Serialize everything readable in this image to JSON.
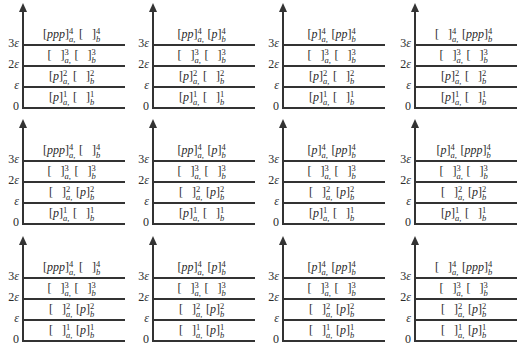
{
  "figure": {
    "y_axis_labels": [
      "0",
      "ε",
      "2ε",
      "3ε"
    ],
    "y_axis_label_parts": [
      {
        "coef": "0",
        "sym": ""
      },
      {
        "coef": "",
        "sym": "ε"
      },
      {
        "coef": "2",
        "sym": "ε"
      },
      {
        "coef": "3",
        "sym": "ε"
      }
    ],
    "group_a_subscript": "a,",
    "group_b_subscript": "b",
    "panels": [
      {
        "row": 1,
        "col": 1,
        "levels": [
          {
            "level": 1,
            "a": "p",
            "b": ""
          },
          {
            "level": 2,
            "a": "p",
            "b": ""
          },
          {
            "level": 3,
            "a": "",
            "b": ""
          },
          {
            "level": 4,
            "a": "ppp",
            "b": ""
          }
        ]
      },
      {
        "row": 1,
        "col": 2,
        "levels": [
          {
            "level": 1,
            "a": "p",
            "b": ""
          },
          {
            "level": 2,
            "a": "p",
            "b": ""
          },
          {
            "level": 3,
            "a": "",
            "b": ""
          },
          {
            "level": 4,
            "a": "pp",
            "b": "p"
          }
        ]
      },
      {
        "row": 1,
        "col": 3,
        "levels": [
          {
            "level": 1,
            "a": "p",
            "b": ""
          },
          {
            "level": 2,
            "a": "p",
            "b": ""
          },
          {
            "level": 3,
            "a": "",
            "b": ""
          },
          {
            "level": 4,
            "a": "p",
            "b": "pp"
          }
        ]
      },
      {
        "row": 1,
        "col": 4,
        "levels": [
          {
            "level": 1,
            "a": "p",
            "b": ""
          },
          {
            "level": 2,
            "a": "p",
            "b": ""
          },
          {
            "level": 3,
            "a": "",
            "b": ""
          },
          {
            "level": 4,
            "a": "",
            "b": "ppp"
          }
        ]
      },
      {
        "row": 2,
        "col": 1,
        "levels": [
          {
            "level": 1,
            "a": "p",
            "b": ""
          },
          {
            "level": 2,
            "a": "",
            "b": "p"
          },
          {
            "level": 3,
            "a": "",
            "b": ""
          },
          {
            "level": 4,
            "a": "ppp",
            "b": ""
          }
        ]
      },
      {
        "row": 2,
        "col": 2,
        "levels": [
          {
            "level": 1,
            "a": "p",
            "b": ""
          },
          {
            "level": 2,
            "a": "",
            "b": "p"
          },
          {
            "level": 3,
            "a": "",
            "b": ""
          },
          {
            "level": 4,
            "a": "pp",
            "b": "p"
          }
        ]
      },
      {
        "row": 2,
        "col": 3,
        "levels": [
          {
            "level": 1,
            "a": "p",
            "b": ""
          },
          {
            "level": 2,
            "a": "",
            "b": "p"
          },
          {
            "level": 3,
            "a": "",
            "b": ""
          },
          {
            "level": 4,
            "a": "p",
            "b": "pp"
          }
        ]
      },
      {
        "row": 2,
        "col": 4,
        "levels": [
          {
            "level": 1,
            "a": "p",
            "b": ""
          },
          {
            "level": 2,
            "a": "",
            "b": "p"
          },
          {
            "level": 3,
            "a": "",
            "b": ""
          },
          {
            "level": 4,
            "a": "p",
            "b": "ppp"
          }
        ]
      },
      {
        "row": 3,
        "col": 1,
        "levels": [
          {
            "level": 1,
            "a": "",
            "b": "p"
          },
          {
            "level": 2,
            "a": "",
            "b": "p"
          },
          {
            "level": 3,
            "a": "",
            "b": ""
          },
          {
            "level": 4,
            "a": "ppp",
            "b": ""
          }
        ]
      },
      {
        "row": 3,
        "col": 2,
        "levels": [
          {
            "level": 1,
            "a": "",
            "b": "p"
          },
          {
            "level": 2,
            "a": "",
            "b": "p"
          },
          {
            "level": 3,
            "a": "",
            "b": ""
          },
          {
            "level": 4,
            "a": "pp",
            "b": "p"
          }
        ]
      },
      {
        "row": 3,
        "col": 3,
        "levels": [
          {
            "level": 1,
            "a": "",
            "b": "p"
          },
          {
            "level": 2,
            "a": "",
            "b": "p"
          },
          {
            "level": 3,
            "a": "",
            "b": ""
          },
          {
            "level": 4,
            "a": "p",
            "b": "pp"
          }
        ]
      },
      {
        "row": 3,
        "col": 4,
        "levels": [
          {
            "level": 1,
            "a": "",
            "b": "p"
          },
          {
            "level": 2,
            "a": "",
            "b": "p"
          },
          {
            "level": 3,
            "a": "",
            "b": ""
          },
          {
            "level": 4,
            "a": "",
            "b": "ppp"
          }
        ]
      }
    ]
  }
}
